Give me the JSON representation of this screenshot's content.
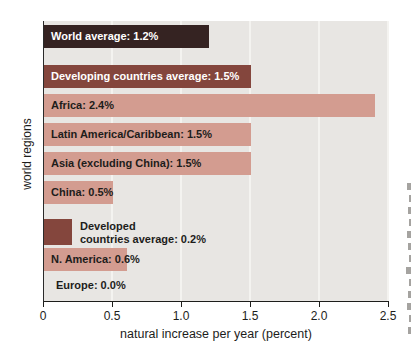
{
  "chart_data": {
    "type": "bar",
    "orientation": "horizontal",
    "xlabel": "natural increase per year (percent)",
    "ylabel": "world regions",
    "xlim": [
      0,
      2.5
    ],
    "x_ticks": [
      "0",
      "0.5",
      "1.0",
      "1.5",
      "2.0",
      "2.5"
    ],
    "grid": "vertical",
    "legend": "none",
    "categories": [
      "World average",
      "Developing countries average",
      "Africa",
      "Latin America/Caribbean",
      "Asia (excluding China)",
      "China",
      "Developed countries average",
      "N. America",
      "Europe"
    ],
    "values": [
      1.2,
      1.5,
      2.4,
      1.5,
      1.5,
      0.5,
      0.2,
      0.6,
      0.0
    ],
    "bars": [
      {
        "region": "World average",
        "value": 1.2,
        "label": "World average: 1.2%",
        "shade": "darkest",
        "label_color": "white",
        "label_position": "inside"
      },
      {
        "region": "Developing countries average",
        "value": 1.5,
        "label": "Developing countries average: 1.5%",
        "shade": "dark",
        "label_color": "white",
        "label_position": "inside"
      },
      {
        "region": "Africa",
        "value": 2.4,
        "label": "Africa: 2.4%",
        "shade": "light",
        "label_color": "black",
        "label_position": "inside"
      },
      {
        "region": "Latin America/Caribbean",
        "value": 1.5,
        "label": "Latin America/Caribbean: 1.5%",
        "shade": "light",
        "label_color": "black",
        "label_position": "inside"
      },
      {
        "region": "Asia (excluding China)",
        "value": 1.5,
        "label": "Asia (excluding China): 1.5%",
        "shade": "light",
        "label_color": "black",
        "label_position": "inside"
      },
      {
        "region": "China",
        "value": 0.5,
        "label": "China: 0.5%",
        "shade": "light",
        "label_color": "black",
        "label_position": "inside"
      },
      {
        "region": "Developed countries average",
        "value": 0.2,
        "label_lines": [
          "Developed",
          "countries average: 0.2%"
        ],
        "shade": "dark",
        "label_color": "black",
        "label_position": "outside"
      },
      {
        "region": "N. America",
        "value": 0.6,
        "label": "N. America: 0.6%",
        "shade": "light",
        "label_color": "black",
        "label_position": "inside"
      },
      {
        "region": "Europe",
        "value": 0.0,
        "label": "Europe: 0.0%",
        "shade": "none",
        "label_color": "black",
        "label_position": "no-bar"
      }
    ],
    "colors": {
      "darkest": "#352322",
      "dark": "#84463d",
      "light": "#d39c90",
      "plot_bg": "#e8e6e3",
      "gridline": "#f4f3f0",
      "axis": "#1d1d1b"
    }
  }
}
